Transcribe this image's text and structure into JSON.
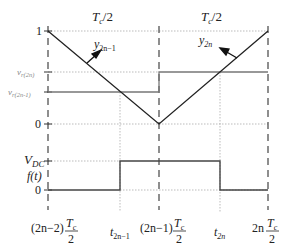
{
  "diagram": {
    "top_panel": {
      "period_labels": [
        "T_c/2",
        "T_c/2"
      ],
      "period_label_main": "T",
      "period_label_sub": "c",
      "period_label_tail": "/2",
      "y_ticks": {
        "one": "1",
        "vr2n_main": "v",
        "vr2n_sub": "r(2n)",
        "vr2n1_main": "v",
        "vr2n1_sub": "r(2n-1)",
        "zero": "0"
      },
      "carrier_labels": {
        "left_main": "y",
        "left_sub": "2n−1",
        "right_main": "y",
        "right_sub": "2n"
      }
    },
    "bottom_panel": {
      "y_ticks": {
        "vdc_main": "V",
        "vdc_sub": "DC",
        "f_label": "f(t)",
        "zero": "0"
      }
    },
    "x_axis": {
      "x0_prefix": "(2n−2)",
      "x1_main": "t",
      "x1_sub": "2n−1",
      "x2_prefix": "(2n−1)",
      "x3_main": "t",
      "x3_sub": "2n",
      "x4_prefix": "2n",
      "frac_num": "T",
      "frac_num_sub": "c",
      "frac_den": "2"
    },
    "colors": {
      "line": "#333333",
      "reference": "#666666",
      "dotted": "#999999"
    }
  }
}
